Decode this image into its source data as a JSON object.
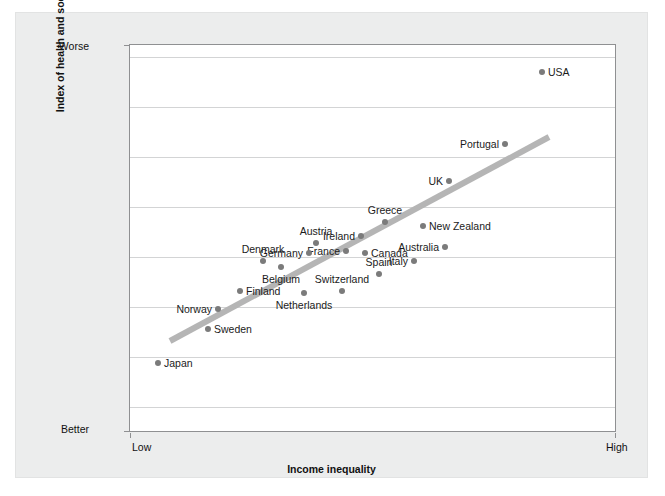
{
  "chart_data": {
    "type": "scatter",
    "title": "",
    "xlabel": "Income inequality",
    "ylabel": "Index of health and social problems",
    "x_tick_labels": [
      "Low",
      "High"
    ],
    "y_tick_labels": [
      "Worse",
      "Better"
    ],
    "y_axis_direction": "Worse at top, Better at bottom",
    "xlim": [
      "Low",
      "High"
    ],
    "ylim": [
      "Better",
      "Worse"
    ],
    "grid": true,
    "gridlines": 8,
    "legend": "none",
    "point_color": "#7b7b7b",
    "trendline_color": "#b5b5b5",
    "trendline": {
      "present": true,
      "x_start_px": 40,
      "y_start_px": 296,
      "x_end_px": 419,
      "y_end_px": 92
    },
    "points": [
      {
        "label": "USA",
        "x_px": 412,
        "y_px": 27,
        "label_pos": "right"
      },
      {
        "label": "Portugal",
        "x_px": 375,
        "y_px": 99,
        "label_pos": "left"
      },
      {
        "label": "UK",
        "x_px": 319,
        "y_px": 136,
        "label_pos": "left"
      },
      {
        "label": "New Zealand",
        "x_px": 293,
        "y_px": 181,
        "label_pos": "right"
      },
      {
        "label": "Greece",
        "x_px": 255,
        "y_px": 177,
        "label_pos": "above"
      },
      {
        "label": "Ireland",
        "x_px": 231,
        "y_px": 191,
        "label_pos": "left"
      },
      {
        "label": "France",
        "x_px": 216,
        "y_px": 206,
        "label_pos": "left"
      },
      {
        "label": "Australia",
        "x_px": 315,
        "y_px": 202,
        "label_pos": "left"
      },
      {
        "label": "Italy",
        "x_px": 284,
        "y_px": 216,
        "label_pos": "left"
      },
      {
        "label": "Austria",
        "x_px": 186,
        "y_px": 198,
        "label_pos": "above"
      },
      {
        "label": "Germany",
        "x_px": 179,
        "y_px": 208,
        "label_pos": "left"
      },
      {
        "label": "Canada",
        "x_px": 235,
        "y_px": 208,
        "label_pos": "right"
      },
      {
        "label": "Spain",
        "x_px": 249,
        "y_px": 229,
        "label_pos": "above"
      },
      {
        "label": "Denmark",
        "x_px": 133,
        "y_px": 216,
        "label_pos": "above"
      },
      {
        "label": "Belgium",
        "x_px": 151,
        "y_px": 222,
        "label_pos": "below"
      },
      {
        "label": "Switzerland",
        "x_px": 212,
        "y_px": 246,
        "label_pos": "above"
      },
      {
        "label": "Netherlands",
        "x_px": 174,
        "y_px": 248,
        "label_pos": "below"
      },
      {
        "label": "Finland",
        "x_px": 110,
        "y_px": 246,
        "label_pos": "right"
      },
      {
        "label": "Norway",
        "x_px": 88,
        "y_px": 264,
        "label_pos": "left"
      },
      {
        "label": "Sweden",
        "x_px": 78,
        "y_px": 284,
        "label_pos": "right"
      },
      {
        "label": "Japan",
        "x_px": 28,
        "y_px": 318,
        "label_pos": "right"
      }
    ],
    "gridline_y_px": [
      12,
      62,
      112,
      162,
      212,
      262,
      312,
      362
    ]
  }
}
